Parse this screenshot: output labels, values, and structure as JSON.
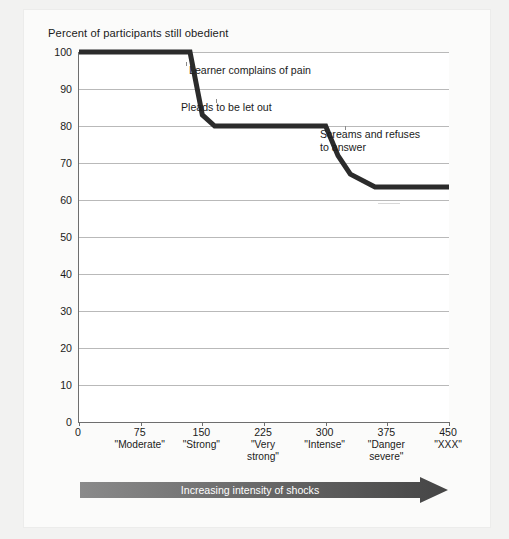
{
  "chart_data": {
    "type": "line",
    "title": "Percent of participants still obedient",
    "xlabel": "Increasing intensity of shocks",
    "ylabel": "Percent of participants still obedient",
    "xlim": [
      0,
      450
    ],
    "ylim": [
      0,
      100
    ],
    "grid": true,
    "legend": "none",
    "y_ticks": [
      0,
      10,
      20,
      30,
      40,
      50,
      60,
      70,
      80,
      90,
      100
    ],
    "x_ticks": [
      0,
      75,
      150,
      225,
      300,
      375,
      450
    ],
    "x_tick_categories": [
      {
        "value": 0,
        "num": "0",
        "category": ""
      },
      {
        "value": 75,
        "num": "75",
        "category": "\"Moderate\""
      },
      {
        "value": 150,
        "num": "150",
        "category": "\"Strong\""
      },
      {
        "value": 225,
        "num": "225",
        "category": "\"Very\nstrong\""
      },
      {
        "value": 300,
        "num": "300",
        "category": "\"Intense\""
      },
      {
        "value": 375,
        "num": "375",
        "category": "\"Danger\nsevere\""
      },
      {
        "value": 450,
        "num": "450",
        "category": "\"XXX\""
      }
    ],
    "series": [
      {
        "name": "Percent still obedient",
        "x": [
          0,
          135,
          150,
          165,
          300,
          315,
          330,
          360,
          450
        ],
        "values": [
          100,
          100,
          83,
          80,
          80,
          72,
          67,
          63.5,
          63.5
        ]
      }
    ],
    "annotations": [
      {
        "text": "Learner complains of pain",
        "x": 150,
        "y": 90
      },
      {
        "text": "Pleads to be let out",
        "x": 150,
        "y": 80
      },
      {
        "text": "Screams and refuses\nto answer",
        "x": 315,
        "y": 75
      }
    ],
    "line_color": "#2b2b2b",
    "grid_color": "#b9b9b9",
    "axis_color": "#6e6e6e",
    "plot_background": "#ffffff"
  },
  "arrow": {
    "label": "Increasing intensity of shocks",
    "start_color": "#7e7e7e",
    "end_color": "#4a4a4a"
  }
}
